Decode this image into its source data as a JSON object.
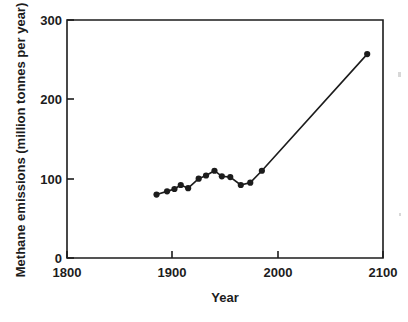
{
  "chart_data": {
    "type": "line",
    "title": "",
    "subtitle": "",
    "xlabel": "Year",
    "ylabel": "Methane emissions (million tonnes per year)",
    "xlim": [
      1800,
      2100
    ],
    "ylim": [
      0,
      300
    ],
    "xticks": [
      1800,
      1900,
      2000,
      2100
    ],
    "xtick_labels": [
      "1800",
      "1900",
      "2000",
      "2100"
    ],
    "yticks": [
      0,
      100,
      200,
      300
    ],
    "ytick_labels": [
      "0",
      "100",
      "200",
      "300"
    ],
    "grid": false,
    "legend": false,
    "legend_position": "none",
    "marker": "filled-circle",
    "line_color": "#1c1c1c",
    "marker_color": "#1c1c1c",
    "background_color": "#ffffff",
    "series": [
      {
        "name": "Methane emissions",
        "x": [
          1885,
          1895,
          1902,
          1908,
          1915,
          1925,
          1932,
          1940,
          1947,
          1955,
          1965,
          1974,
          1985,
          2085
        ],
        "values": [
          80,
          84,
          87,
          92,
          88,
          100,
          104,
          110,
          103,
          102,
          92,
          95,
          110,
          257
        ]
      }
    ]
  },
  "axis": {
    "x_title": "Year",
    "y_title": "Methane emissions (million tonnes per year)"
  }
}
